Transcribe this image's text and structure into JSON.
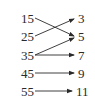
{
  "diagram": {
    "type": "mapping",
    "domain": [
      "15",
      "25",
      "35",
      "45",
      "55"
    ],
    "range": [
      "3",
      "5",
      "7",
      "9",
      "11"
    ],
    "arrows": [
      {
        "from": "15",
        "to": "5"
      },
      {
        "from": "25",
        "to": "3"
      },
      {
        "from": "35",
        "to": "5"
      },
      {
        "from": "35",
        "to": "7"
      },
      {
        "from": "45",
        "to": "9"
      },
      {
        "from": "55",
        "to": "11"
      }
    ],
    "line_color": "#2a2a2a"
  }
}
